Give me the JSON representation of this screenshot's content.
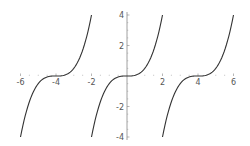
{
  "chart_data": {
    "type": "line",
    "title": "",
    "xlabel": "",
    "ylabel": "",
    "xlim": [
      -6,
      6
    ],
    "ylim": [
      -4,
      4
    ],
    "grid": false,
    "legend": null,
    "x_ticks": [
      -6,
      -4,
      -2,
      2,
      4,
      6
    ],
    "x_tick_labels": [
      "-6",
      "-4",
      "-2",
      "2",
      "4",
      "6"
    ],
    "y_ticks": [
      4,
      2,
      -2,
      -4
    ],
    "y_tick_labels": [
      "4",
      "2",
      "-2",
      "-4"
    ],
    "series": [
      {
        "name": "segment-1",
        "description": "y = (x+4)^3/2 on [-6,-2]",
        "x": [
          -6,
          -5,
          -4,
          -3,
          -2
        ],
        "y": [
          -4,
          -0.5,
          0,
          0.5,
          4
        ]
      },
      {
        "name": "segment-2",
        "description": "y = x^3/2 on [-2,2]",
        "x": [
          -2,
          -1,
          0,
          1,
          2
        ],
        "y": [
          -4,
          -0.5,
          0,
          0.5,
          4
        ]
      },
      {
        "name": "segment-3",
        "description": "y = (x-4)^3/2 on [2,6]",
        "x": [
          2,
          3,
          4,
          5,
          6
        ],
        "y": [
          -4,
          -0.5,
          0,
          0.5,
          4
        ]
      }
    ],
    "colors": {
      "curve": "#333333",
      "axis": "#888888",
      "x_axis_left": "#8a8ad8",
      "x_axis_right": "#d89a9a"
    }
  }
}
